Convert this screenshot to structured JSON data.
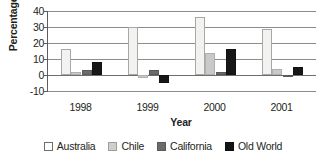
{
  "chart_data": {
    "type": "bar",
    "title": "",
    "xlabel": "Year",
    "ylabel": "Percentage",
    "categories": [
      "1998",
      "1999",
      "2000",
      "2001"
    ],
    "series": [
      {
        "name": "Australia",
        "color": "#f2f2f0",
        "values": [
          16,
          30,
          36,
          29
        ]
      },
      {
        "name": "Chile",
        "color": "#c9c9c7",
        "values": [
          2,
          -2,
          14,
          4
        ]
      },
      {
        "name": "California",
        "color": "#6b6b6b",
        "values": [
          3,
          3,
          2,
          -1
        ]
      },
      {
        "name": "Old World",
        "color": "#171717",
        "values": [
          8,
          -5,
          16,
          5
        ]
      }
    ],
    "ylim": [
      -10,
      40
    ],
    "yticks": [
      "40",
      "30",
      "20",
      "10",
      "0",
      "-10"
    ],
    "ytick_values": [
      40,
      30,
      20,
      10,
      0,
      -10
    ],
    "grid": true,
    "legend_position": "bottom"
  },
  "legend": {
    "items": [
      {
        "label": "Australia"
      },
      {
        "label": "Chile"
      },
      {
        "label": "California"
      },
      {
        "label": "Old World"
      }
    ]
  }
}
